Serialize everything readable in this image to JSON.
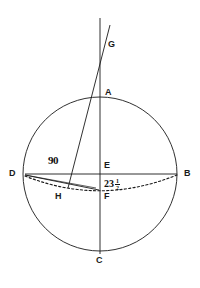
{
  "figure": {
    "kind": "geometry-diagram",
    "stroke_color": "#1a1a1a",
    "background_color": "#ffffff",
    "circle": {
      "cx": 100,
      "cy": 174,
      "r": 77
    },
    "points": [
      {
        "id": "G",
        "label": "G",
        "x": 103,
        "y": 44,
        "label_x": 108,
        "label_y": 40
      },
      {
        "id": "A",
        "label": "A",
        "x": 100,
        "y": 97,
        "label_x": 105,
        "label_y": 88
      },
      {
        "id": "E",
        "label": "E",
        "x": 100,
        "y": 174,
        "label_x": 104,
        "label_y": 162
      },
      {
        "id": "B",
        "label": "B",
        "x": 177,
        "y": 174,
        "label_x": 184,
        "label_y": 170
      },
      {
        "id": "D",
        "label": "D",
        "x": 25,
        "y": 174,
        "label_x": 10,
        "label_y": 170
      },
      {
        "id": "F",
        "label": "F",
        "x": 100,
        "y": 190,
        "label_x": 104,
        "label_y": 192
      },
      {
        "id": "H",
        "label": "H",
        "x": 62,
        "y": 192,
        "label_x": 55,
        "label_y": 192
      },
      {
        "id": "C",
        "label": "C",
        "x": 100,
        "y": 251,
        "label_x": 96,
        "label_y": 256
      }
    ],
    "measures": [
      {
        "id": "angle-90",
        "text": "90",
        "x": 48,
        "y": 155
      },
      {
        "id": "angle-23-half",
        "whole": "23",
        "numerator": "1",
        "denominator": "2",
        "x": 104,
        "y": 178
      }
    ]
  }
}
